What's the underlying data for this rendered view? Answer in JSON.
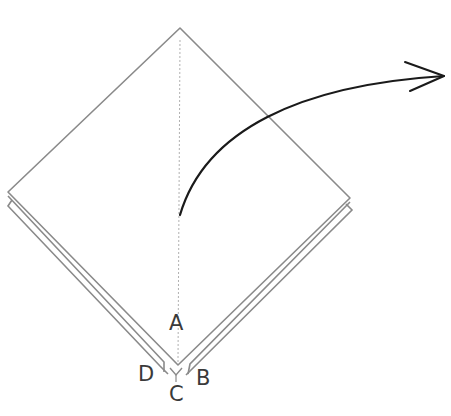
{
  "diagram": {
    "type": "origami-fold-step",
    "labels": {
      "a": "A",
      "b": "B",
      "c": "C",
      "d": "D"
    },
    "colors": {
      "paper_fill": "#ffffff",
      "paper_edge": "#8a8a8a",
      "crease": "#b0b0b0",
      "arrow": "#1a1a1a",
      "label": "#3a3a3a"
    }
  }
}
